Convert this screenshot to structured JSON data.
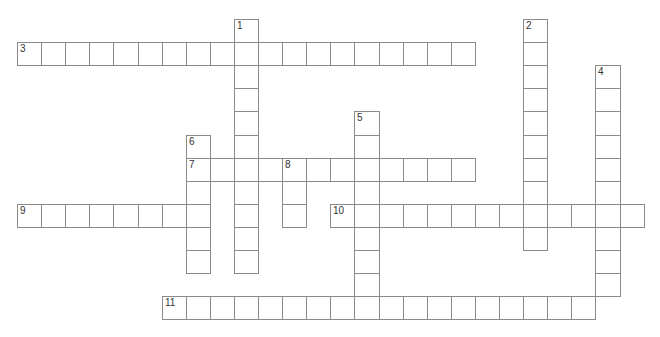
{
  "puzzle": {
    "type": "crossword",
    "grid": {
      "origin_x": 17,
      "origin_y": 19,
      "cell_w": 24.1,
      "cell_h": 23.1
    },
    "colors": {
      "border": "#8a8a8a",
      "background": "#ffffff",
      "number": "#333333"
    },
    "entries": [
      {
        "number": "1",
        "direction": "down",
        "row": 0,
        "col": 9,
        "length": 11
      },
      {
        "number": "2",
        "direction": "down",
        "row": 0,
        "col": 21,
        "length": 10
      },
      {
        "number": "3",
        "direction": "across",
        "row": 1,
        "col": 0,
        "length": 19
      },
      {
        "number": "4",
        "direction": "down",
        "row": 2,
        "col": 24,
        "length": 10
      },
      {
        "number": "5",
        "direction": "down",
        "row": 4,
        "col": 14,
        "length": 9
      },
      {
        "number": "6",
        "direction": "down",
        "row": 5,
        "col": 7,
        "length": 6
      },
      {
        "number": "7",
        "direction": "across",
        "row": 6,
        "col": 7,
        "length": 12
      },
      {
        "number": "8",
        "direction": "down",
        "row": 6,
        "col": 11,
        "length": 3
      },
      {
        "number": "9",
        "direction": "across",
        "row": 8,
        "col": 0,
        "length": 8
      },
      {
        "number": "10",
        "direction": "across",
        "row": 8,
        "col": 13,
        "length": 13
      },
      {
        "number": "11",
        "direction": "across",
        "row": 12,
        "col": 6,
        "length": 18
      }
    ]
  }
}
